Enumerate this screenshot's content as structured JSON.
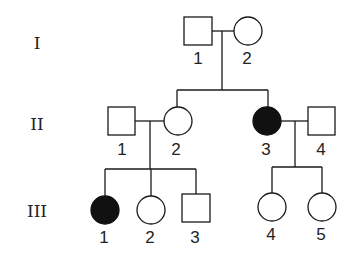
{
  "diagram": {
    "type": "pedigree",
    "generations": [
      {
        "label": "I",
        "y": 43
      },
      {
        "label": "II",
        "y": 124
      },
      {
        "label": "III",
        "y": 211
      }
    ],
    "individuals": {
      "I_1": {
        "label": "1",
        "sex": "male",
        "affected": false
      },
      "I_2": {
        "label": "2",
        "sex": "female",
        "affected": false
      },
      "II_1": {
        "label": "1",
        "sex": "male",
        "affected": false
      },
      "II_2": {
        "label": "2",
        "sex": "female",
        "affected": false
      },
      "II_3": {
        "label": "3",
        "sex": "female",
        "affected": true
      },
      "II_4": {
        "label": "4",
        "sex": "male",
        "affected": false
      },
      "III_1": {
        "label": "1",
        "sex": "female",
        "affected": true
      },
      "III_2": {
        "label": "2",
        "sex": "female",
        "affected": false
      },
      "III_3": {
        "label": "3",
        "sex": "male",
        "affected": false
      },
      "III_4": {
        "label": "4",
        "sex": "female",
        "affected": false
      },
      "III_5": {
        "label": "5",
        "sex": "female",
        "affected": false
      }
    },
    "matings": [
      {
        "partners": [
          "I_1",
          "I_2"
        ],
        "children": [
          "II_2",
          "II_3"
        ]
      },
      {
        "partners": [
          "II_1",
          "II_2"
        ],
        "children": [
          "III_1",
          "III_2",
          "III_3"
        ]
      },
      {
        "partners": [
          "II_3",
          "II_4"
        ],
        "children": [
          "III_4",
          "III_5"
        ]
      }
    ],
    "colors": {
      "line": "#1a1a1a",
      "affected_fill": "#111111",
      "unaffected_fill": "#ffffff"
    }
  }
}
